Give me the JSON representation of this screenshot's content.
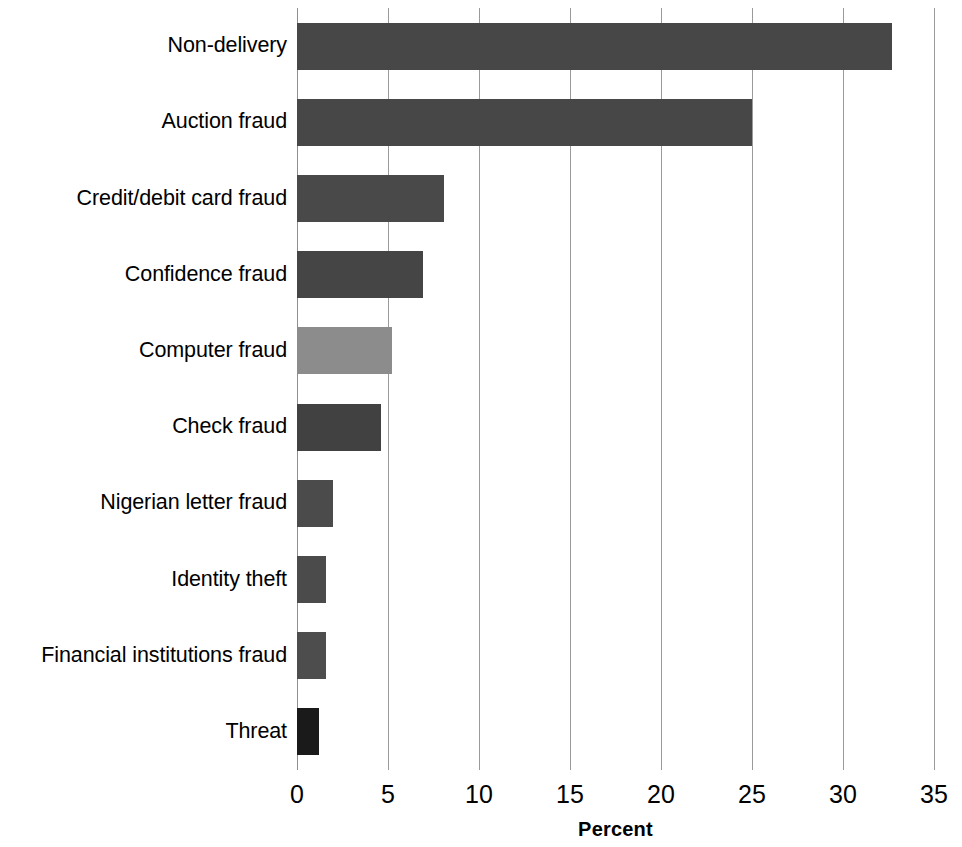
{
  "chart_data": {
    "type": "bar",
    "orientation": "horizontal",
    "title": "",
    "xlabel": "Percent",
    "ylabel": "",
    "xlim": [
      0,
      35
    ],
    "ylim": null,
    "grid": true,
    "legend": null,
    "xticks": [
      0,
      5,
      10,
      15,
      20,
      25,
      30,
      35
    ],
    "xtick_labels": [
      "0",
      "5",
      "10",
      "15",
      "20",
      "25",
      "30",
      "35"
    ],
    "categories": [
      "Non-delivery",
      "Auction fraud",
      "Credit/debit card fraud",
      "Confidence fraud",
      "Computer fraud",
      "Check fraud",
      "Nigerian letter fraud",
      "Identity theft",
      "Financial institutions fraud",
      "Threat"
    ],
    "values": [
      32.7,
      25.0,
      8.1,
      6.9,
      5.2,
      4.6,
      2.0,
      1.6,
      1.6,
      1.2
    ],
    "bar_colors": [
      "#474747",
      "#474747",
      "#494949",
      "#454545",
      "#8c8c8c",
      "#414141",
      "#4b4b4b",
      "#4b4b4b",
      "#4d4d4d",
      "#1a1a1a"
    ],
    "colors": {
      "default_bar": "#474747",
      "highlight_bar": "#8c8c8c",
      "dark_bar": "#1a1a1a",
      "gridline": "#9a9a9a",
      "text": "#000000",
      "background": "#ffffff"
    }
  }
}
